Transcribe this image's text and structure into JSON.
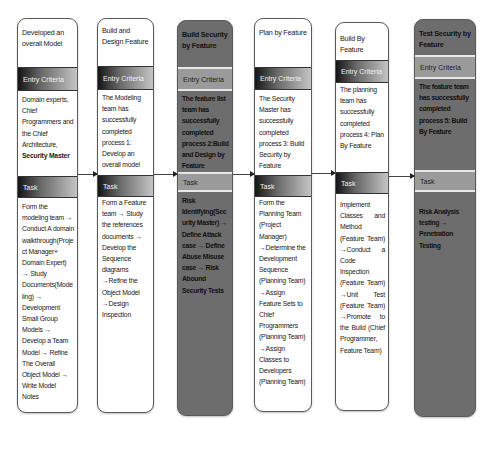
{
  "diagram": {
    "entry_label": "Entry Criteria",
    "task_label": "Task",
    "columns": [
      {
        "title": "Developed an overall Model",
        "entry": "Domain experts, Chief Programmers and the Chief Architecture,",
        "entry_bold": "Security Master",
        "task": "Form the modeling team → Conduct A domain walkthrough(Project Manager+ Domain Expert) → Study Documents(Modeling) → Development Small Group Models → Develop a Team Model → Refine The Overall Object Model → Write Model Notes",
        "style": "light"
      },
      {
        "title": "Build and Design Feature",
        "entry": "The Modeling team has successfully completed process 1: Develop an overall model",
        "task": "Form a Feature team → Study the references documents → Develop the Sequence diagrams →Refine the Object Model →Design Inspection",
        "style": "light"
      },
      {
        "title": "Build Security by Feature",
        "entry": "The feature list team has successfully completed process 2:Build and Design by Feature",
        "task": "Risk Identifying(Security Master) → Define Attack case → Define Abuse Misuse case → Risk Abound Security Tests",
        "style": "dark"
      },
      {
        "title": "Plan by Feature",
        "entry": "The Security Master has successfully completed process 3: Build Security by Feature",
        "task": "Form the Planning Team (Project Manager) →Determine the Development Sequence (Planning Team) →Assign Feature Sets to Chief Programmers (Planning Team) →Assign Classes to Developers (Planning Team)",
        "style": "light"
      },
      {
        "title": "Build By Feature",
        "entry": "The planning team has successfully completed process 4: Plan By Feature",
        "task": "Implement Classes and Method (Feature Team) →Conduct a Code Inspection (Feature Team) →Unit Test (Feature Team) →Promote to the Build (Chief Programmer, Feature Team)",
        "style": "light"
      },
      {
        "title": "Test Security by Feature",
        "entry": "The feature team has successfully completed process 5: Build By Feature",
        "task": "Risk Analysis testing → Penetration Testing",
        "style": "dark"
      }
    ]
  }
}
